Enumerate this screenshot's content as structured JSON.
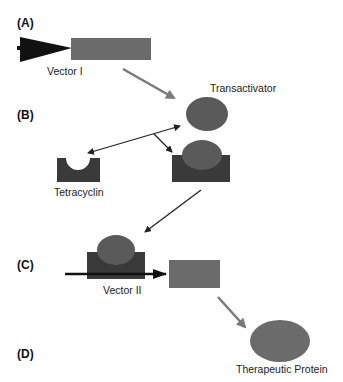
{
  "panels": {
    "a": "(A)",
    "b": "(B)",
    "c": "(C)",
    "d": "(D)"
  },
  "labels": {
    "vector1": "Vector I",
    "transactivator": "Transactivator",
    "tetracyclin": "Tetracyclin",
    "vector2": "Vector II",
    "therapeutic_protein": "Therapeutic Protein"
  },
  "colors": {
    "promoter": "#111111",
    "gene": "#6b6b6b",
    "transactivator": "#5a5a5a",
    "operator_block": "#3a3a3a",
    "arrow_gray": "#7a7a7a",
    "arrow_dark": "#222222",
    "expression_arrow": "#111111"
  }
}
